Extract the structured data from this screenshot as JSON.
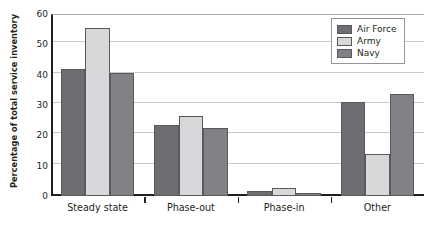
{
  "chart_data": {
    "type": "bar",
    "title": "",
    "xlabel": "",
    "ylabel": "Percentage of total service inventory",
    "categories": [
      "Steady state",
      "Phase-out",
      "Phase-in",
      "Other"
    ],
    "series": [
      {
        "name": "Air Force",
        "color": "#6d6e71",
        "values": [
          42,
          23.5,
          1.5,
          31
        ]
      },
      {
        "name": "Army",
        "color": "#d7d8da",
        "values": [
          55.5,
          26.5,
          2.5,
          14
        ]
      },
      {
        "name": "Navy",
        "color": "#808285",
        "values": [
          40.5,
          22.5,
          1,
          33.5
        ]
      }
    ],
    "ylim": [
      0,
      60
    ],
    "yticks": [
      0,
      10,
      20,
      30,
      40,
      50,
      60
    ],
    "ytick_labels": [
      "0",
      "10",
      "20",
      "30",
      "40",
      "50",
      "60"
    ],
    "grid": "horizontal",
    "legend_position": "top-right"
  },
  "legend": {
    "entries": [
      {
        "label": "Air Force"
      },
      {
        "label": "Army"
      },
      {
        "label": "Navy"
      }
    ]
  }
}
